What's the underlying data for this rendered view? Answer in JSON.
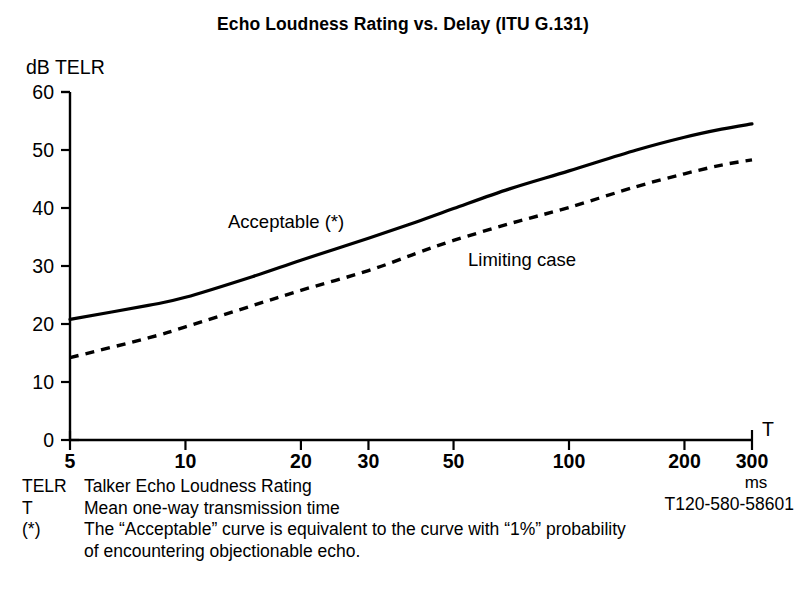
{
  "title": "Echo Loudness Rating vs. Delay (ITU G.131)",
  "figure_id": "T120-580-58601",
  "axes": {
    "y_axis_name": "dB TELR",
    "x_axis_name": "T",
    "x_unit": "ms",
    "y_ticks": [
      "0",
      "10",
      "20",
      "30",
      "40",
      "50",
      "60"
    ],
    "x_ticks": [
      "5",
      "10",
      "20",
      "30",
      "50",
      "100",
      "200",
      "300"
    ]
  },
  "curve_labels": {
    "acceptable": "Acceptable (*)",
    "limiting": "Limiting case"
  },
  "footer": {
    "rows": [
      {
        "key": "TELR",
        "text": "Talker Echo Loudness Rating"
      },
      {
        "key": "T",
        "text": "Mean one-way transmission time"
      },
      {
        "key": "(*)",
        "text": "The “Acceptable” curve is equivalent to the curve with “1%” probability"
      }
    ],
    "continuation": "of encountering objectionable echo."
  },
  "chart_data": {
    "type": "line",
    "title": "Echo Loudness Rating vs. Delay (ITU G.131)",
    "xlabel": "T (ms) — Mean one-way transmission time",
    "ylabel": "dB TELR",
    "xscale": "log",
    "xlim": [
      5,
      300
    ],
    "ylim": [
      0,
      60
    ],
    "grid": false,
    "legend_position": "inline-annotations",
    "x_tick_values": [
      5,
      10,
      20,
      30,
      50,
      100,
      200,
      300
    ],
    "y_tick_values": [
      0,
      10,
      20,
      30,
      40,
      50,
      60
    ],
    "series": [
      {
        "name": "Acceptable (*)",
        "style": "solid",
        "x": [
          5,
          8,
          10,
          15,
          20,
          30,
          40,
          50,
          70,
          100,
          150,
          200,
          250,
          300
        ],
        "values": [
          20.8,
          23.2,
          24.6,
          28.2,
          31.0,
          34.8,
          37.6,
          39.9,
          43.3,
          46.4,
          50.0,
          52.2,
          53.6,
          54.5
        ]
      },
      {
        "name": "Limiting case",
        "style": "dashed",
        "x": [
          5,
          8,
          10,
          15,
          20,
          30,
          40,
          50,
          70,
          100,
          150,
          200,
          250,
          300
        ],
        "values": [
          14.2,
          17.6,
          19.5,
          23.2,
          25.8,
          29.2,
          32.2,
          34.4,
          37.3,
          40.1,
          43.7,
          45.9,
          47.4,
          48.3
        ]
      }
    ]
  }
}
